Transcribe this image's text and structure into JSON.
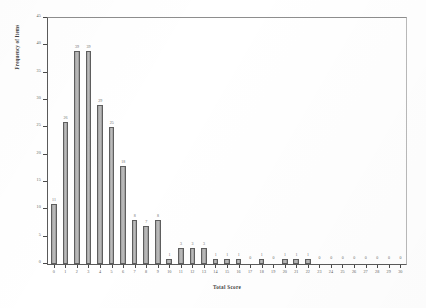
{
  "chart_data": {
    "type": "bar",
    "title": "",
    "xlabel": "Total Score",
    "ylabel": "Frequency of Items",
    "categories": [
      "0",
      "1",
      "2",
      "3",
      "4",
      "5",
      "6",
      "7",
      "8",
      "9",
      "10",
      "11",
      "12",
      "13",
      "14",
      "15",
      "16",
      "17",
      "18",
      "19",
      "20",
      "21",
      "22",
      "23",
      "24",
      "25",
      "26",
      "27",
      "28",
      "29",
      "30"
    ],
    "values": [
      11,
      26,
      39,
      39,
      29,
      25,
      18,
      8,
      7,
      8,
      1,
      3,
      3,
      3,
      1,
      1,
      1,
      0,
      1,
      0,
      1,
      1,
      1,
      0,
      0,
      0,
      0,
      0,
      0,
      0,
      0
    ],
    "bar_labels": [
      "11",
      "26",
      "39",
      "39",
      "29",
      "25",
      "18",
      "8",
      "7",
      "8",
      "1",
      "3",
      "3",
      "3",
      "1",
      "1",
      "1",
      "0",
      "1",
      "0",
      "1",
      "1",
      "1",
      "0",
      "0",
      "0",
      "0",
      "0",
      "0",
      "0",
      "0"
    ],
    "ylim": [
      0,
      45
    ],
    "xlim_categories": 31,
    "y_ticks": [
      "0",
      "5",
      "10",
      "15",
      "20",
      "25",
      "30",
      "35",
      "40",
      "45"
    ],
    "y_tick_values": [
      0,
      5,
      10,
      15,
      20,
      25,
      30,
      35,
      40,
      45
    ],
    "x_ticks": [
      "0",
      "1",
      "2",
      "3",
      "4",
      "5",
      "6",
      "7",
      "8",
      "9",
      "10",
      "11",
      "12",
      "13",
      "14",
      "15",
      "16",
      "17",
      "18",
      "19",
      "20",
      "21",
      "22",
      "23",
      "24",
      "25",
      "26",
      "27",
      "28",
      "29",
      "30"
    ],
    "grid": false,
    "legend": false,
    "bar_fill_color": "#b5b5b5",
    "bar_edge_color": "#5e5e5e",
    "axis_color": "#5a5a5a",
    "text_color": "#5d5d5d",
    "background_color": "#ffffff"
  }
}
